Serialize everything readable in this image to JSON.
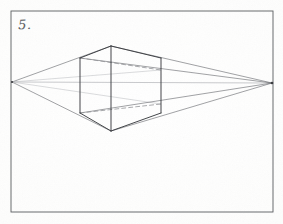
{
  "artwork": {
    "title": "Two-Point Perspective Box Construction",
    "medium": "pencil on paper",
    "label": "5.",
    "background_color": "#fdfdfc",
    "ink_color": "#3a3c40",
    "faint_ink_color": "#9a9ca0",
    "frame": {
      "name": "drawing-border",
      "left": 11,
      "top": 11,
      "right": 273,
      "bottom": 212,
      "stroke_color": "#5a5c60",
      "stroke_width": 0.9
    },
    "horizon": {
      "name": "horizon-line",
      "y_left": 82,
      "y_right": 83,
      "x_start": 12,
      "x_end": 272,
      "stroke_color": "#b0b2b6",
      "stroke_width": 0.7
    },
    "vanishing_points": [
      {
        "name": "left-vanishing-point",
        "x": 12,
        "y": 82
      },
      {
        "name": "right-vanishing-point",
        "x": 272,
        "y": 83
      }
    ],
    "box": {
      "name": "perspective-box",
      "front_edge": {
        "x": 111,
        "y_top": 46,
        "y_bottom": 131
      },
      "left_edge": {
        "x": 80,
        "y_top": 58,
        "y_bottom": 113
      },
      "right_edge": {
        "x": 161,
        "y_top": 58,
        "y_bottom": 113
      },
      "back_edge_hidden": {
        "x": 161,
        "y_top": 70,
        "y_bottom": 104
      }
    },
    "solid_lines": [
      {
        "name": "top-left-face-edge",
        "x1": 80,
        "y1": 58,
        "x2": 111,
        "y2": 46
      },
      {
        "name": "top-right-face-edge",
        "x1": 111,
        "y1": 46,
        "x2": 161,
        "y2": 58
      },
      {
        "name": "bottom-left-face-edge",
        "x1": 80,
        "y1": 113,
        "x2": 111,
        "y2": 131
      },
      {
        "name": "bottom-right-face-edge",
        "x1": 111,
        "y1": 131,
        "x2": 161,
        "y2": 113
      },
      {
        "name": "front-vertical-edge",
        "x1": 111,
        "y1": 46,
        "x2": 111,
        "y2": 131
      },
      {
        "name": "left-vertical-edge",
        "x1": 80,
        "y1": 58,
        "x2": 80,
        "y2": 113
      },
      {
        "name": "right-vertical-edge",
        "x1": 161,
        "y1": 58,
        "x2": 161,
        "y2": 113
      }
    ],
    "dashed_lines": [
      {
        "name": "hidden-top-back-edge-left",
        "x1": 80,
        "y1": 58,
        "x2": 161,
        "y2": 70
      },
      {
        "name": "hidden-bottom-back-edge-left",
        "x1": 80,
        "y1": 113,
        "x2": 161,
        "y2": 104
      },
      {
        "name": "hidden-back-vertical-edge",
        "x1": 161,
        "y1": 70,
        "x2": 161,
        "y2": 104
      }
    ],
    "guide_lines": [
      {
        "name": "guide-left-vp-to-top-apex",
        "x1": 12,
        "y1": 82,
        "x2": 111,
        "y2": 46
      },
      {
        "name": "guide-left-vp-to-bottom-apex",
        "x1": 12,
        "y1": 82,
        "x2": 111,
        "y2": 131
      },
      {
        "name": "guide-left-vp-to-right-top",
        "x1": 12,
        "y1": 82,
        "x2": 161,
        "y2": 70
      },
      {
        "name": "guide-left-vp-to-right-bottom",
        "x1": 12,
        "y1": 82,
        "x2": 161,
        "y2": 104
      },
      {
        "name": "guide-right-vp-to-top-apex",
        "x1": 272,
        "y1": 83,
        "x2": 111,
        "y2": 46
      },
      {
        "name": "guide-right-vp-to-bottom-apex",
        "x1": 272,
        "y1": 83,
        "x2": 111,
        "y2": 131
      },
      {
        "name": "guide-right-vp-to-left-top",
        "x1": 272,
        "y1": 83,
        "x2": 80,
        "y2": 58
      },
      {
        "name": "guide-right-vp-to-left-bottom",
        "x1": 272,
        "y1": 83,
        "x2": 80,
        "y2": 113
      }
    ]
  }
}
